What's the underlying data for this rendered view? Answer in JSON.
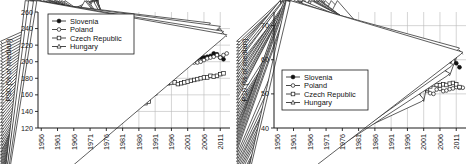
{
  "figure": {
    "panel_count": 2,
    "background": "#ffffff",
    "foreground": "#1a1a1a",
    "grid_color": "#b9b9b9"
  },
  "legend": {
    "entries": [
      {
        "label": "Slovenia",
        "marker": "filled-circle"
      },
      {
        "label": "Poland",
        "marker": "open-circle"
      },
      {
        "label": "Czech Republic",
        "marker": "open-square"
      },
      {
        "label": "Hungary",
        "marker": "open-triangle"
      }
    ]
  },
  "chart_data": [
    {
      "id": "p90-panel",
      "type": "line",
      "title": "",
      "xlabel": "",
      "ylabel": "P90  (% of median)",
      "xlim": [
        1955,
        2014
      ],
      "ylim": [
        120,
        260
      ],
      "yticks": [
        120,
        140,
        160,
        180,
        200,
        220,
        240,
        260
      ],
      "xticks": [
        1956,
        1961,
        1966,
        1971,
        1976,
        1981,
        1986,
        1991,
        1996,
        2001,
        2006,
        2011
      ],
      "grid": true,
      "legend_position": "top-left",
      "series": [
        {
          "name": "Slovenia",
          "marker": "filled-circle",
          "x": [
            1961,
            1962,
            1963,
            1964,
            1965,
            1966,
            1967,
            1968,
            1969,
            1970,
            1971,
            1972,
            1973,
            1974,
            1975,
            1976,
            1977,
            1978,
            1979,
            1980,
            1981,
            1982,
            1983,
            1984,
            1985,
            1986,
            1987,
            1988,
            1989,
            1990,
            1991,
            1992,
            1993,
            1994,
            1995,
            1996,
            1997,
            1998,
            1999,
            2000,
            2001,
            2002,
            2003,
            2004,
            2005,
            2006,
            2007,
            2008,
            2009,
            2010,
            2011,
            2012
          ],
          "values": [
            181,
            182,
            182,
            181,
            180,
            179,
            177,
            170,
            174,
            175,
            175,
            173,
            172,
            170,
            168,
            166,
            165,
            160,
            161,
            162,
            163,
            149,
            157,
            157,
            157,
            157,
            157,
            156,
            160,
            163,
            166,
            178,
            181,
            186,
            190,
            192,
            193,
            203,
            196,
            199,
            200,
            202,
            203,
            204,
            205,
            205,
            206,
            207,
            210,
            209,
            205,
            203
          ]
        },
        {
          "name": "Poland",
          "marker": "open-circle",
          "x": [
            1956,
            1957,
            1958,
            1959,
            1960,
            1961,
            1962,
            1963,
            1964,
            1965,
            1966,
            1967,
            1968,
            1969,
            1970,
            1971,
            1972,
            1973,
            1974,
            1975,
            1976,
            1977,
            1978,
            1979,
            1980,
            1981,
            1982,
            1983,
            1984,
            1985,
            1986,
            1987,
            1988,
            1989,
            1990,
            1991,
            1992,
            1993,
            1994,
            1995,
            1996,
            1997,
            1998,
            1999,
            2000,
            2001,
            2002,
            2003,
            2004,
            2005,
            2006,
            2007,
            2008,
            2009,
            2010,
            2011,
            2012,
            2013
          ],
          "values": [
            182,
            180,
            178,
            176,
            174,
            172,
            170,
            170,
            169,
            168,
            167,
            166,
            165,
            164,
            163,
            162,
            166,
            169,
            172,
            174,
            177,
            180,
            180,
            178,
            174,
            163,
            157,
            157,
            158,
            160,
            165,
            168,
            172,
            169,
            172,
            180,
            184,
            191,
            196,
            197,
            198,
            198,
            197,
            199,
            201,
            200,
            200,
            199,
            199,
            200,
            202,
            204,
            205,
            206,
            208,
            205,
            208,
            210
          ]
        },
        {
          "name": "Czech Republic",
          "marker": "open-square",
          "x": [
            1956,
            1957,
            1958,
            1959,
            1960,
            1961,
            1962,
            1963,
            1964,
            1965,
            1966,
            1967,
            1968,
            1969,
            1970,
            1971,
            1972,
            1973,
            1974,
            1975,
            1976,
            1977,
            1978,
            1979,
            1980,
            1981,
            1982,
            1983,
            1984,
            1985,
            1986,
            1987,
            1988,
            1989,
            1990,
            1991,
            1992,
            1993,
            1994,
            1995,
            1996,
            1997,
            1998,
            1999,
            2000,
            2001,
            2002,
            2003,
            2004,
            2005,
            2006,
            2007,
            2008,
            2009,
            2010,
            2011,
            2012
          ],
          "values": [
            158,
            153,
            151,
            152,
            153,
            154,
            154,
            155,
            155,
            156,
            155,
            155,
            154,
            153,
            153,
            153,
            153,
            154,
            153,
            152,
            152,
            154,
            155,
            156,
            157,
            157,
            157,
            157,
            157,
            157,
            156,
            157,
            150,
            152,
            163,
            162,
            168,
            173,
            174,
            174,
            175,
            175,
            173,
            174,
            175,
            176,
            177,
            178,
            179,
            180,
            181,
            181,
            183,
            182,
            183,
            185,
            186
          ]
        },
        {
          "name": "Hungary",
          "marker": "open-triangle",
          "x": [
            1956,
            1957,
            1958,
            1959,
            1960,
            1961,
            1962,
            1963,
            1964,
            1965,
            1966,
            1967,
            1968,
            1969,
            1970,
            1971,
            1972,
            1973,
            1974,
            1975,
            1976,
            1977,
            1978,
            1979,
            1980,
            1981,
            1982,
            1983,
            1984,
            1985,
            1986,
            1987,
            1988,
            1989,
            1990,
            1991,
            1992,
            1993,
            1994,
            1995,
            1996,
            1997,
            1998,
            1999,
            2000,
            2001,
            2002,
            2003,
            2004,
            2005,
            2006,
            2007,
            2008,
            2009,
            2010,
            2011,
            2012,
            2013
          ],
          "values": [
            164,
            161,
            159,
            158,
            157,
            156,
            156,
            156,
            157,
            158,
            159,
            160,
            161,
            162,
            163,
            163,
            161,
            159,
            158,
            157,
            158,
            159,
            159,
            158,
            157,
            157,
            157,
            157,
            157,
            158,
            159,
            162,
            168,
            170,
            172,
            196,
            200,
            203,
            206,
            208,
            209,
            212,
            214,
            215,
            216,
            218,
            222,
            226,
            228,
            230,
            234,
            238,
            244,
            236,
            238,
            240,
            234,
            230
          ]
        }
      ]
    },
    {
      "id": "p10-panel",
      "type": "line",
      "title": "",
      "xlabel": "",
      "ylabel": "P10  (% of median)",
      "xlim": [
        1955,
        2014
      ],
      "ylim": [
        40,
        74
      ],
      "yticks": [
        40,
        50,
        60,
        70
      ],
      "xticks": [
        1956,
        1961,
        1966,
        1971,
        1976,
        1981,
        1986,
        1991,
        1996,
        2001,
        2006,
        2011
      ],
      "grid": true,
      "legend_position": "bottom-left",
      "series": [
        {
          "name": "Slovenia",
          "marker": "filled-circle",
          "x": [
            1963,
            1964,
            1965,
            1966,
            1967,
            1968,
            1969,
            1970,
            1971,
            1972,
            1973,
            1974,
            1975,
            1976,
            1977,
            1978,
            1979,
            1980,
            1981,
            1982,
            1983,
            1984,
            1985,
            1986,
            1987,
            1988,
            1989,
            1990,
            1991,
            1992,
            1993,
            1994,
            1995,
            1996,
            1997,
            1998,
            1999,
            2000,
            2001,
            2002,
            2003,
            2004,
            2005,
            2006,
            2007,
            2008,
            2009,
            2010,
            2011,
            2012
          ],
          "values": [
            59.2,
            60.0,
            61.0,
            63.3,
            62.8,
            64.0,
            64.3,
            65.0,
            67.0,
            67.2,
            67.0,
            67.2,
            67.5,
            68.3,
            67.5,
            68.3,
            68.6,
            68.5,
            69.0,
            68.8,
            66.3,
            66.2,
            66.8,
            66.5,
            66.6,
            64.3,
            63.0,
            61.8,
            60.0,
            58.3,
            58.8,
            59.0,
            59.2,
            58.9,
            58.4,
            57.9,
            58.2,
            58.3,
            58.6,
            58.4,
            59.0,
            58.8,
            59.1,
            58.0,
            57.6,
            58.0,
            59.6,
            60.7,
            59.0,
            57.8
          ]
        },
        {
          "name": "Poland",
          "marker": "open-circle",
          "x": [
            1956,
            1957,
            1958,
            1959,
            1960,
            1961,
            1962,
            1963,
            1964,
            1965,
            1966,
            1967,
            1968,
            1969,
            1970,
            1971,
            1972,
            1973,
            1974,
            1975,
            1976,
            1977,
            1978,
            1979,
            1980,
            1981,
            1982,
            1983,
            1984,
            1985,
            1986,
            1987,
            1988,
            1989,
            1990,
            1991,
            1992,
            1993,
            1994,
            1995,
            1996,
            1997,
            1998,
            1999,
            2000,
            2001,
            2002,
            2003,
            2004,
            2005,
            2006,
            2007,
            2008,
            2009,
            2010,
            2011,
            2012,
            2013
          ],
          "values": [
            57.8,
            55.8,
            55.2,
            55.6,
            56.3,
            56.5,
            57.0,
            57.1,
            56.3,
            56.0,
            56.5,
            56.4,
            56.6,
            56.5,
            56.4,
            59.4,
            60.2,
            59.8,
            60.0,
            58.0,
            57.6,
            58.8,
            59.0,
            60.4,
            61.3,
            63.0,
            63.4,
            62.8,
            62.5,
            63.2,
            63.3,
            62.2,
            63.0,
            63.0,
            62.4,
            61.2,
            58.0,
            56.8,
            56.3,
            55.8,
            55.0,
            54.6,
            54.4,
            53.5,
            52.8,
            52.3,
            51.0,
            50.2,
            50.0,
            51.3,
            51.5,
            50.8,
            51.0,
            51.4,
            51.6,
            52.0,
            51.8,
            51.8
          ]
        },
        {
          "name": "Czech Republic",
          "marker": "open-square",
          "x": [
            1956,
            1957,
            1958,
            1959,
            1960,
            1961,
            1962,
            1963,
            1964,
            1965,
            1966,
            1967,
            1968,
            1969,
            1970,
            1971,
            1972,
            1973,
            1974,
            1975,
            1976,
            1977,
            1978,
            1979,
            1980,
            1981,
            1982,
            1983,
            1984,
            1985,
            1986,
            1987,
            1988,
            1989,
            1990,
            1991,
            1992,
            1993,
            1994,
            1995,
            1996,
            1997,
            1998,
            1999,
            2000,
            2001,
            2002,
            2003,
            2004,
            2005,
            2006,
            2007,
            2008,
            2009,
            2010,
            2011,
            2012
          ],
          "values": [
            62.5,
            62.0,
            63.0,
            62.5,
            63.2,
            63.4,
            63.0,
            63.3,
            64.2,
            63.5,
            63.7,
            63.2,
            63.0,
            64.3,
            63.0,
            64.5,
            61.8,
            60.2,
            60.0,
            60.6,
            61.0,
            62.8,
            63.0,
            63.5,
            64.0,
            63.4,
            63.0,
            62.4,
            63.0,
            63.3,
            63.5,
            63.1,
            62.8,
            63.0,
            61.5,
            58.2,
            56.8,
            56.6,
            56.4,
            55.5,
            55.0,
            54.0,
            53.8,
            53.2,
            53.4,
            52.0,
            51.6,
            52.2,
            52.8,
            52.6,
            52.5,
            52.8,
            52.6,
            53.0,
            53.2,
            52.8,
            52.0
          ]
        },
        {
          "name": "Hungary",
          "marker": "open-triangle",
          "x": [
            1956,
            1957,
            1958,
            1959,
            1960,
            1961,
            1962,
            1963,
            1964,
            1965,
            1966,
            1967,
            1968,
            1969,
            1970,
            1971,
            1972,
            1973,
            1974,
            1975,
            1976,
            1977,
            1978,
            1979,
            1980,
            1981,
            1982,
            1983,
            1984,
            1985,
            1986,
            1987,
            1988,
            1989,
            1990,
            1991,
            1992,
            1993,
            1994,
            1995,
            1996,
            1997,
            1998,
            1999,
            2000,
            2001,
            2002,
            2003,
            2004,
            2005,
            2006,
            2007,
            2008,
            2009,
            2010,
            2011,
            2012,
            2013
          ],
          "values": [
            64.5,
            63.8,
            64.0,
            64.5,
            64.6,
            63.8,
            63.2,
            63.6,
            62.0,
            62.3,
            62.8,
            62.5,
            62.6,
            62.2,
            62.5,
            62.0,
            62.0,
            61.8,
            62.2,
            58.5,
            57.3,
            57.6,
            58.0,
            59.0,
            59.2,
            59.5,
            61.8,
            62.0,
            63.0,
            63.4,
            63.0,
            62.8,
            62.5,
            61.8,
            61.5,
            58.0,
            56.2,
            54.6,
            53.5,
            53.8,
            53.0,
            52.4,
            52.0,
            51.4,
            49.6,
            47.8,
            52.6,
            53.0,
            53.2,
            54.0,
            54.6,
            55.0,
            56.0,
            55.4,
            58.0,
            60.5,
            62.8,
            61.6
          ]
        }
      ]
    }
  ]
}
